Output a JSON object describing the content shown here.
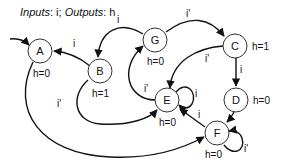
{
  "title": {
    "inputs_label": "Inputs",
    "inputs_value": "i",
    "outputs_label": "Outputs",
    "outputs_value": "h"
  },
  "states": [
    {
      "id": "A",
      "output": "h=0"
    },
    {
      "id": "B",
      "output": "h=1"
    },
    {
      "id": "G",
      "output": "h=0"
    },
    {
      "id": "C",
      "output": "h=1"
    },
    {
      "id": "D",
      "output": "h=0"
    },
    {
      "id": "E",
      "output": "h=0"
    },
    {
      "id": "F",
      "output": "h=0"
    }
  ],
  "transitions": [
    {
      "from": "start",
      "to": "A",
      "label": ""
    },
    {
      "from": "B",
      "to": "A",
      "label": "i"
    },
    {
      "from": "G",
      "to": "B",
      "label": "i"
    },
    {
      "from": "G",
      "to": "C",
      "label": "i'"
    },
    {
      "from": "C",
      "to": "E",
      "label": "i'"
    },
    {
      "from": "C",
      "to": "D",
      "label": "i"
    },
    {
      "from": "E",
      "to": "G",
      "label": "i'"
    },
    {
      "from": "E",
      "to": "E",
      "label": "i"
    },
    {
      "from": "B",
      "to": "E",
      "label": "i'"
    },
    {
      "from": "D",
      "to": "F",
      "label": ""
    },
    {
      "from": "F",
      "to": "E",
      "label": "i"
    },
    {
      "from": "F",
      "to": "F",
      "label": "i'"
    },
    {
      "from": "A",
      "to": "F",
      "label": ""
    }
  ]
}
